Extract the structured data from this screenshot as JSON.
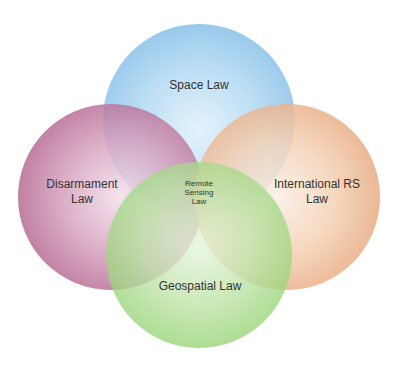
{
  "diagram": {
    "type": "venn",
    "sets": [
      {
        "id": "space",
        "label": "Space Law",
        "color": "#8cc2e8"
      },
      {
        "id": "disarmament",
        "label_lines": [
          "Disarmament",
          "Law"
        ],
        "color": "#b05f8a"
      },
      {
        "id": "international",
        "label_lines": [
          "International RS",
          "Law"
        ],
        "color": "#e6a57a"
      },
      {
        "id": "geospatial",
        "label": "Geospatial Law",
        "color": "#8fd06c"
      }
    ],
    "intersection": {
      "label_lines": [
        "Remote",
        "Sensing",
        "Law"
      ]
    }
  }
}
